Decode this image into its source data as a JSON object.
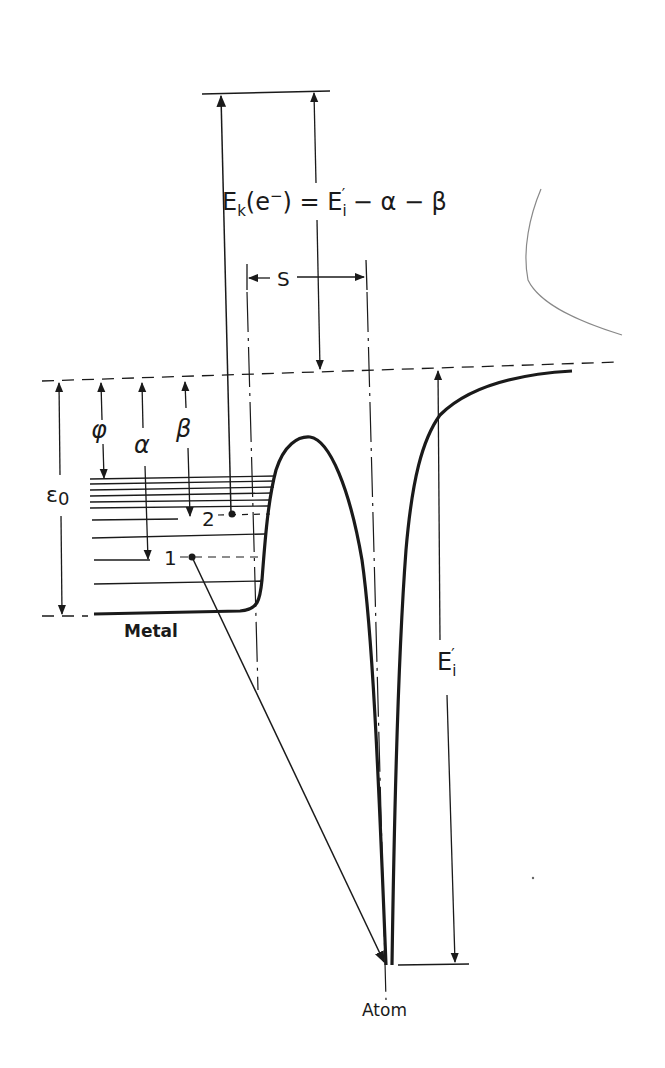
{
  "diagram": {
    "type": "energy-level diagram",
    "labels": {
      "equation_lhs": "E",
      "equation_k": "k",
      "equation_e": "(e",
      "equation_minus": "−",
      "equation_rest": ") = E",
      "equation_i": "i",
      "equation_prime": "′",
      "equation_tail": " − α − β",
      "separation": "S",
      "work_function": "φ",
      "alpha": "α",
      "beta": "β",
      "epsilon": "ε",
      "epsilon_sub": "0",
      "level_1": "1",
      "level_2": "2",
      "metal": "Metal",
      "atom": "Atom",
      "ionization_E": "E",
      "ionization_sub": "i",
      "ionization_prime": "′"
    },
    "colors": {
      "ink": "#1a1a1a",
      "faint_curve": "#888888",
      "background": "#ffffff"
    }
  }
}
